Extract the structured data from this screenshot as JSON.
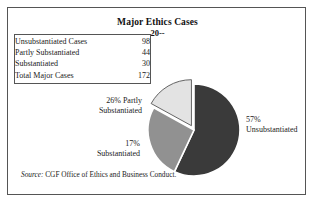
{
  "figure": {
    "title": "Major Ethics Cases",
    "subtitle": "20--",
    "source_label": "Source:",
    "source_text": "CGF Office of Ethics and Business Conduct.",
    "frame_color": "#555555",
    "background_color": "#ffffff"
  },
  "table": {
    "rows": [
      {
        "label": "Unsubstantiated Cases",
        "value": "98"
      },
      {
        "label": "Partly Substantiated",
        "value": "44"
      },
      {
        "label": "Substantiated",
        "value": "30"
      },
      {
        "label": "Total Major Cases",
        "value": "172"
      }
    ]
  },
  "callouts": {
    "partly_line1": "26% Partly",
    "partly_line2": "Substantiated",
    "substantiated_line1": "17%",
    "substantiated_line2": "Substantiated",
    "unsubstantiated_line1": "57%",
    "unsubstantiated_line2": "Unsubstantiated"
  },
  "chart_data": {
    "type": "pie",
    "title": "Major Ethics Cases",
    "subtitle": "20--",
    "labels": [
      "Unsubstantiated",
      "Partly Substantiated",
      "Substantiated"
    ],
    "values": [
      98,
      44,
      30
    ],
    "percentages": [
      57,
      26,
      17
    ],
    "total": 172,
    "colors": [
      "#3a3a3a",
      "#919191",
      "#e3e3e3"
    ],
    "slice_border_color": "#ffffff",
    "slice_outline_color": "#555555",
    "exploded": [
      "Substantiated"
    ],
    "start_angle_deg": 0,
    "direction": "clockwise",
    "legend": "none",
    "grid": false,
    "data_labels": [
      "57% Unsubstantiated",
      "26% Partly Substantiated",
      "17% Substantiated"
    ]
  }
}
